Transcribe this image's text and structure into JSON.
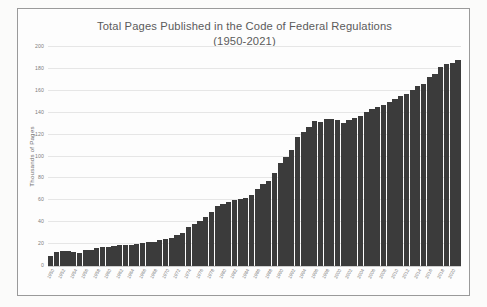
{
  "figure": {
    "title_line1": "Total Pages Published in the Code of Federal Regulations",
    "title_line2": "(1950-2021)",
    "background_color": "#fdfdfd",
    "frame_color": "#9a9a9a",
    "bar_color": "#3b3b3b",
    "gridline_color": "#e6e6e6",
    "text_color": "#6d6d6d"
  },
  "chart_data": {
    "type": "bar",
    "xlabel": "",
    "ylabel": "Thousands of Pages",
    "ylim": [
      0,
      200
    ],
    "yticks": [
      0,
      20,
      40,
      60,
      80,
      100,
      120,
      140,
      160,
      180,
      200
    ],
    "ytick_labels": [
      "0",
      "20",
      "40",
      "60",
      "80",
      "100",
      "120",
      "140",
      "160",
      "180",
      "200"
    ],
    "grid": true,
    "legend": false,
    "xtick_step_years": 2,
    "xtick_labels": [
      "1950",
      "1952",
      "1954",
      "1956",
      "1958",
      "1960",
      "1962",
      "1964",
      "1966",
      "1968",
      "1970",
      "1972",
      "1974",
      "1976",
      "1978",
      "1980",
      "1982",
      "1984",
      "1986",
      "1988",
      "1990",
      "1992",
      "1994",
      "1996",
      "1998",
      "2000",
      "2002",
      "2004",
      "2006",
      "2008",
      "2010",
      "2012",
      "2014",
      "2016",
      "2018",
      "2020"
    ],
    "categories": [
      "1950",
      "1951",
      "1952",
      "1953",
      "1954",
      "1955",
      "1956",
      "1957",
      "1958",
      "1959",
      "1960",
      "1961",
      "1962",
      "1963",
      "1964",
      "1965",
      "1966",
      "1967",
      "1968",
      "1969",
      "1970",
      "1971",
      "1972",
      "1973",
      "1974",
      "1975",
      "1976",
      "1977",
      "1978",
      "1979",
      "1980",
      "1981",
      "1982",
      "1983",
      "1984",
      "1985",
      "1986",
      "1987",
      "1988",
      "1989",
      "1990",
      "1991",
      "1992",
      "1993",
      "1994",
      "1995",
      "1996",
      "1997",
      "1998",
      "1999",
      "2000",
      "2001",
      "2002",
      "2003",
      "2004",
      "2005",
      "2006",
      "2007",
      "2008",
      "2009",
      "2010",
      "2011",
      "2012",
      "2013",
      "2014",
      "2015",
      "2016",
      "2017",
      "2018",
      "2019",
      "2020",
      "2021"
    ],
    "values": [
      9.6,
      13.0,
      14.0,
      13.5,
      13.0,
      12.0,
      14.5,
      14.5,
      16.0,
      17.0,
      17.5,
      18.5,
      19.0,
      19.5,
      19.0,
      20.5,
      21.0,
      21.5,
      22.0,
      23.5,
      24.5,
      26.0,
      28.0,
      30.5,
      35.5,
      38.5,
      41.0,
      45.0,
      49.0,
      55.0,
      57.0,
      58.5,
      60.0,
      61.5,
      62.5,
      65.0,
      70.5,
      74.5,
      78.0,
      85.0,
      94.0,
      100.0,
      106.0,
      118.0,
      122.5,
      127.0,
      132.0,
      131.5,
      134.0,
      134.0,
      133.5,
      131.0,
      133.5,
      135.5,
      137.0,
      140.5,
      143.5,
      145.0,
      147.0,
      149.5,
      152.5,
      155.0,
      157.5,
      161.0,
      164.0,
      166.0,
      172.5,
      175.5,
      181.5,
      184.5,
      185.5,
      188.0
    ]
  },
  "yaxis": {
    "title": "Thousands of Pages"
  }
}
